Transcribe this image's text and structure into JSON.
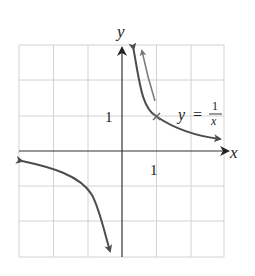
{
  "figure": {
    "function_label": {
      "lhs": "y",
      "eq": "=",
      "numerator": "1",
      "denominator": "x"
    },
    "axes": {
      "x_label": "x",
      "y_label": "y",
      "x_tick": "1",
      "y_tick": "1"
    },
    "grid": {
      "xmin": -3,
      "xmax": 3,
      "ymin": -3,
      "ymax": 3,
      "step": 1
    },
    "colors": {
      "curve": "#4d4d4d",
      "axis": "#222222",
      "grid": "#d0d0d0",
      "arrow_hint": "#6a6a6a"
    },
    "marked_point": {
      "x": 1,
      "y": 1
    }
  }
}
